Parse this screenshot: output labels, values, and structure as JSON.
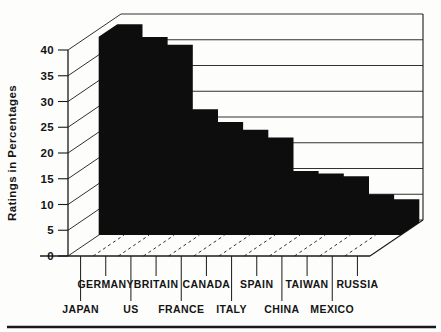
{
  "figure": {
    "kind": "scanned-textbook-figure",
    "background": "#fdfdfc",
    "bottom_rule_color": "#1a1a1a"
  },
  "chart_data": {
    "type": "bar",
    "projection": "3d-oblique",
    "title": "",
    "ylabel": "Ratings in Percentages",
    "xlabel": "",
    "categories": [
      "JAPAN",
      "GERMANY",
      "US",
      "BRITAIN",
      "FRANCE",
      "CANADA",
      "ITALY",
      "SPAIN",
      "CHINA",
      "TAIWAN",
      "MEXICO",
      "RUSSIA"
    ],
    "values": [
      38.5,
      36,
      34.5,
      22,
      19.5,
      18,
      16.5,
      10,
      9.5,
      9,
      5.5,
      4.5
    ],
    "ylim": [
      0,
      40
    ],
    "ytick_step": 5,
    "ytick_labels": [
      "0",
      "5",
      "10",
      "15",
      "20",
      "25",
      "30",
      "35",
      "40"
    ],
    "grid": true,
    "legend": false,
    "bar_color": "#0d0d0d",
    "line_color": "#1a1a1a",
    "label_rows": "alternating"
  }
}
